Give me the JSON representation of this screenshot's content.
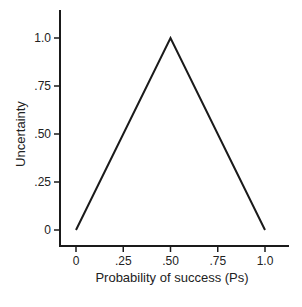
{
  "chart_data": {
    "type": "line",
    "title": "",
    "xlabel": "Probability of success (Ps)",
    "ylabel": "Uncertainty",
    "x_ticks": [
      "0",
      ".25",
      ".50",
      ".75",
      "1.0"
    ],
    "y_ticks": [
      "0",
      ".25",
      ".50",
      ".75",
      "1.0"
    ],
    "xlim": [
      0,
      1.0
    ],
    "ylim": [
      0,
      1.0
    ],
    "grid": false,
    "legend": null,
    "series": [
      {
        "name": "Uncertainty",
        "x": [
          0,
          0.5,
          1.0
        ],
        "y": [
          0,
          1.0,
          0
        ]
      }
    ],
    "line_color": "#1a1a1a"
  }
}
